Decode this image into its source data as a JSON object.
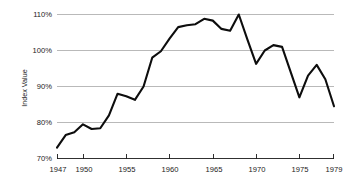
{
  "chart_data": {
    "type": "line",
    "title": "",
    "xlabel": "",
    "ylabel": "Index Value",
    "xlim": [
      1947,
      1979
    ],
    "ylim": [
      70,
      110
    ],
    "grid": true,
    "legend": false,
    "y_ticks": [
      70,
      80,
      90,
      100,
      110
    ],
    "y_tick_labels": [
      "70%",
      "80%",
      "90%",
      "100%",
      "110%"
    ],
    "x_ticks": [
      1947,
      1950,
      1955,
      1960,
      1965,
      1970,
      1975,
      1979
    ],
    "x_tick_labels": [
      "1947",
      "1950",
      "1955",
      "1960",
      "1965",
      "1970",
      "1975",
      "1979"
    ],
    "series": [
      {
        "name": "Index Value",
        "color": "#0d0d0d",
        "x": [
          1947,
          1948,
          1949,
          1950,
          1951,
          1952,
          1953,
          1954,
          1955,
          1956,
          1957,
          1958,
          1959,
          1960,
          1961,
          1962,
          1963,
          1964,
          1965,
          1966,
          1967,
          1968,
          1969,
          1970,
          1971,
          1972,
          1973,
          1974,
          1975,
          1976,
          1977,
          1978,
          1979
        ],
        "values": [
          73.0,
          76.5,
          77.3,
          79.5,
          78.2,
          78.4,
          82.0,
          88.0,
          87.3,
          86.3,
          90.0,
          98.0,
          99.8,
          103.3,
          106.5,
          107.0,
          107.3,
          108.8,
          108.3,
          106.0,
          105.5,
          110.0,
          103.0,
          96.3,
          100.0,
          101.5,
          101.0,
          94.0,
          87.0,
          93.0,
          96.0,
          92.0,
          84.5
        ]
      }
    ]
  },
  "axis": {
    "y_label": "Index Value"
  }
}
